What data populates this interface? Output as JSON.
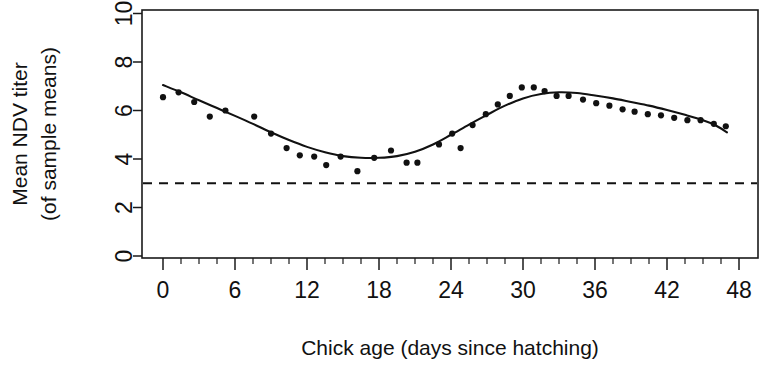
{
  "chart_data": {
    "type": "scatter",
    "title": "",
    "xlabel": "Chick age (days since hatching)",
    "ylabel": "Mean NDV titer\n(of sample means)",
    "ylabel_line1": "Mean NDV titer",
    "ylabel_line2": "(of sample means)",
    "xlim": [
      -1.5,
      49.5
    ],
    "ylim": [
      0,
      10
    ],
    "xticks": [
      0,
      6,
      12,
      18,
      24,
      30,
      36,
      42,
      48
    ],
    "xtick_labels": [
      "0",
      "6",
      "12",
      "18",
      "24",
      "30",
      "36",
      "42",
      "48"
    ],
    "xminor_step": 1.5,
    "yticks": [
      0,
      2,
      4,
      6,
      8,
      10
    ],
    "ytick_labels": [
      "0",
      "2",
      "4",
      "6",
      "8",
      "10"
    ],
    "grid": false,
    "legend": null,
    "box": true,
    "series": [
      {
        "name": "Mean NDV titer (sample means)",
        "marker": "filled-circle",
        "color": "#111111",
        "points": [
          [
            0.0,
            6.55
          ],
          [
            1.3,
            6.75
          ],
          [
            2.6,
            6.35
          ],
          [
            3.9,
            5.75
          ],
          [
            5.2,
            6.0
          ],
          [
            7.6,
            5.75
          ],
          [
            9.0,
            5.05
          ],
          [
            10.3,
            4.45
          ],
          [
            11.4,
            4.15
          ],
          [
            12.6,
            4.1
          ],
          [
            13.6,
            3.75
          ],
          [
            14.8,
            4.1
          ],
          [
            16.2,
            3.5
          ],
          [
            17.6,
            4.05
          ],
          [
            19.0,
            4.35
          ],
          [
            20.3,
            3.85
          ],
          [
            21.2,
            3.85
          ],
          [
            23.0,
            4.6
          ],
          [
            24.1,
            5.05
          ],
          [
            24.8,
            4.45
          ],
          [
            25.8,
            5.4
          ],
          [
            26.9,
            5.85
          ],
          [
            27.9,
            6.25
          ],
          [
            28.9,
            6.6
          ],
          [
            29.9,
            6.95
          ],
          [
            30.9,
            6.95
          ],
          [
            31.8,
            6.8
          ],
          [
            32.8,
            6.6
          ],
          [
            33.8,
            6.6
          ],
          [
            35.0,
            6.45
          ],
          [
            36.1,
            6.3
          ],
          [
            37.2,
            6.2
          ],
          [
            38.3,
            6.05
          ],
          [
            39.3,
            5.95
          ],
          [
            40.4,
            5.85
          ],
          [
            41.5,
            5.8
          ],
          [
            42.6,
            5.7
          ],
          [
            43.7,
            5.6
          ],
          [
            44.8,
            5.6
          ],
          [
            45.9,
            5.45
          ],
          [
            46.9,
            5.35
          ]
        ]
      }
    ],
    "fit_curve": {
      "name": "smoothed fit",
      "style": "solid",
      "color": "#111111",
      "points": [
        [
          0.0,
          7.05
        ],
        [
          1.5,
          6.75
        ],
        [
          3.0,
          6.42
        ],
        [
          4.5,
          6.1
        ],
        [
          6.0,
          5.78
        ],
        [
          7.5,
          5.45
        ],
        [
          9.0,
          5.1
        ],
        [
          10.5,
          4.78
        ],
        [
          12.0,
          4.5
        ],
        [
          13.5,
          4.28
        ],
        [
          15.0,
          4.12
        ],
        [
          16.5,
          4.05
        ],
        [
          18.0,
          4.05
        ],
        [
          19.5,
          4.12
        ],
        [
          21.0,
          4.3
        ],
        [
          22.5,
          4.6
        ],
        [
          24.0,
          5.0
        ],
        [
          25.5,
          5.42
        ],
        [
          27.0,
          5.82
        ],
        [
          28.5,
          6.2
        ],
        [
          30.0,
          6.5
        ],
        [
          31.5,
          6.68
        ],
        [
          33.0,
          6.75
        ],
        [
          34.5,
          6.72
        ],
        [
          36.0,
          6.62
        ],
        [
          37.5,
          6.5
        ],
        [
          39.0,
          6.35
        ],
        [
          40.5,
          6.2
        ],
        [
          42.0,
          6.02
        ],
        [
          43.5,
          5.82
        ],
        [
          45.0,
          5.6
        ],
        [
          46.0,
          5.4
        ],
        [
          47.0,
          5.1
        ]
      ]
    },
    "reference_line": {
      "name": "detection threshold",
      "orientation": "horizontal",
      "value": 3.0,
      "style": "dashed",
      "color": "#111111"
    }
  }
}
